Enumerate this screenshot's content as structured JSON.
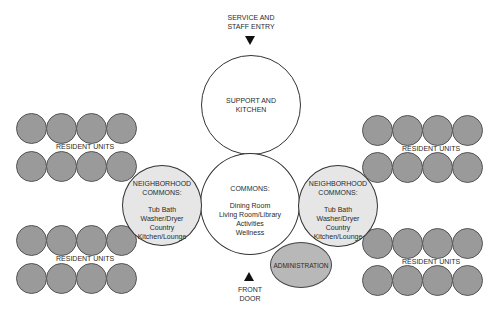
{
  "diagram": {
    "type": "space-planning bubble diagram",
    "colors": {
      "resident_units": "#9a9a9a",
      "neighborhood_commons": "#e6e6e6",
      "administration": "#b8b8b8",
      "core_spaces": "#ffffff",
      "outline": "#333333"
    },
    "service_entry": {
      "line1": "SERVICE AND",
      "line2": "STAFF ENTRY",
      "arrow": "triangle-down-icon"
    },
    "support": {
      "line1": "SUPPORT AND",
      "line2": "KITCHEN"
    },
    "commons": {
      "title": "COMMONS:",
      "items": [
        "Dining Room",
        "Living Room/Library",
        "Activities",
        "Wellness"
      ]
    },
    "neighborhood_left": {
      "title1": "NEIGHBORHOOD",
      "title2": "COMMONS:",
      "items": [
        "Tub Bath",
        "Washer/Dryer",
        "Country",
        "Kitchen/Lounge"
      ]
    },
    "neighborhood_right": {
      "title1": "NEIGHBORHOOD",
      "title2": "COMMONS:",
      "items": [
        "Tub Bath",
        "Washer/Dryer",
        "Country",
        "Kitchen/Lounge"
      ]
    },
    "administration": {
      "label": "ADMINISTRATION"
    },
    "front_door": {
      "line1": "FRONT",
      "line2": "DOOR",
      "arrow": "triangle-up-icon"
    },
    "resident_clusters": [
      {
        "position": "top-left",
        "label": "RESIDENT UNITS",
        "units_per_row": 4,
        "rows": 2
      },
      {
        "position": "bottom-left",
        "label": "RESIDENT UNITS",
        "units_per_row": 4,
        "rows": 2
      },
      {
        "position": "top-right",
        "label": "RESIDENT UNITS",
        "units_per_row": 4,
        "rows": 2
      },
      {
        "position": "bottom-right",
        "label": "RESIDENT UNITS",
        "units_per_row": 4,
        "rows": 2
      }
    ]
  }
}
